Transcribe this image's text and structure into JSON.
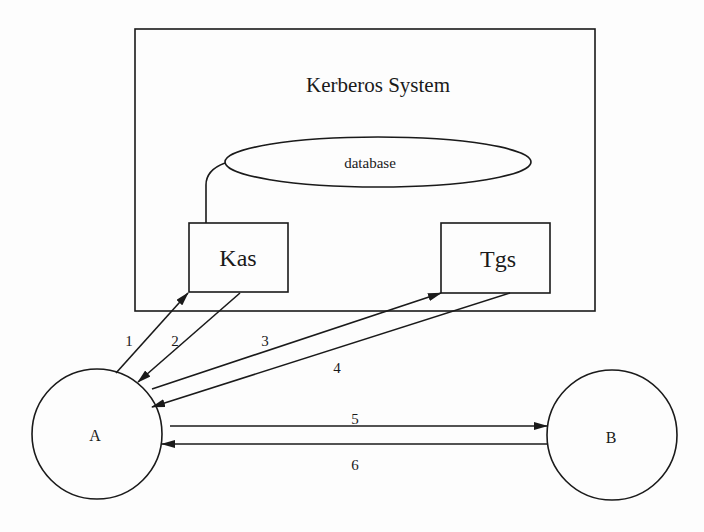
{
  "diagram": {
    "system": {
      "title": "Kerberos System",
      "database_label": "database",
      "kas_label": "Kas",
      "tgs_label": "Tgs"
    },
    "nodes": {
      "a_label": "A",
      "b_label": "B"
    },
    "messages": [
      {
        "label": "1",
        "from": "A",
        "to": "Kas"
      },
      {
        "label": "2",
        "from": "Kas",
        "to": "A"
      },
      {
        "label": "3",
        "from": "A",
        "to": "Tgs"
      },
      {
        "label": "4",
        "from": "Tgs",
        "to": "A"
      },
      {
        "label": "5",
        "from": "A",
        "to": "B"
      },
      {
        "label": "6",
        "from": "B",
        "to": "A"
      }
    ],
    "colors": {
      "ink": "#1a1a1a",
      "background": "#fdfdfd"
    }
  }
}
